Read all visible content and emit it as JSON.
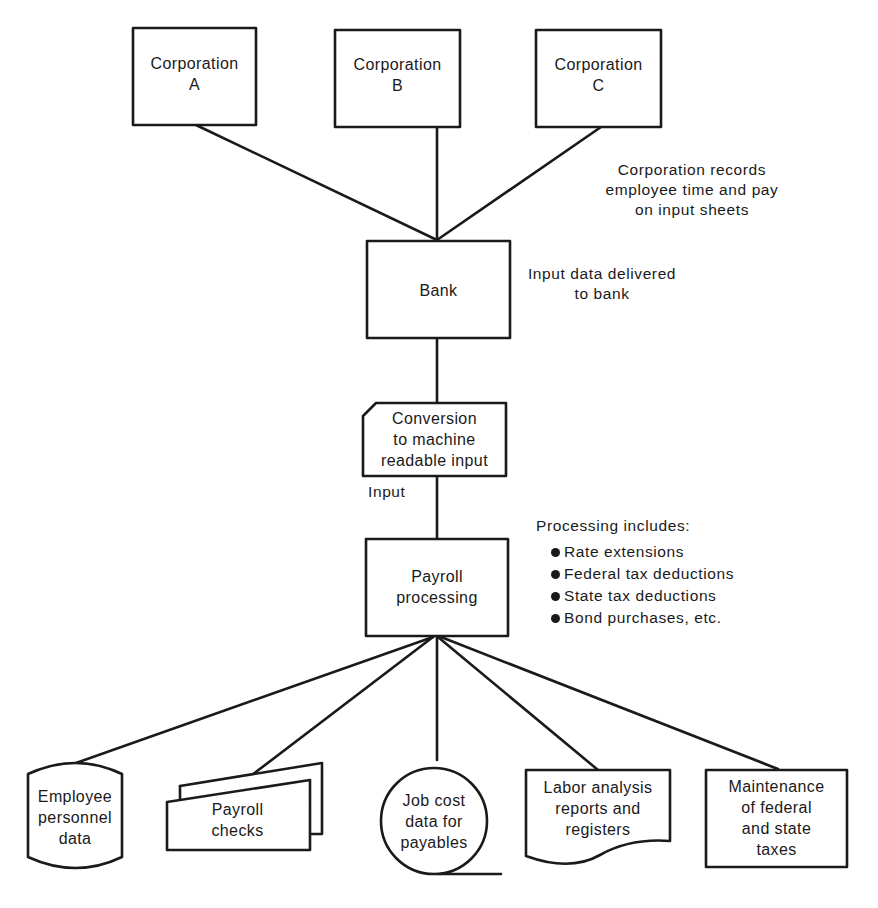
{
  "diagram": {
    "type": "flowchart",
    "nodes": {
      "corp_a": {
        "shape": "process-box",
        "label": "Corporation\nA"
      },
      "corp_b": {
        "shape": "process-box",
        "label": "Corporation\nB"
      },
      "corp_c": {
        "shape": "process-box",
        "label": "Corporation\nC"
      },
      "bank": {
        "shape": "process-box",
        "label": "Bank"
      },
      "conversion": {
        "shape": "punched-card",
        "label": "Conversion\nto machine\nreadable input"
      },
      "payroll": {
        "shape": "process-box",
        "label": "Payroll\nprocessing"
      },
      "employee_data": {
        "shape": "magnetic-disk",
        "label": "Employee\npersonnel\ndata"
      },
      "payroll_checks": {
        "shape": "multi-document",
        "label": "Payroll\nchecks"
      },
      "job_cost": {
        "shape": "magnetic-tape",
        "label": "Job cost\ndata for\npayables"
      },
      "labor_analysis": {
        "shape": "document",
        "label": "Labor analysis\nreports and\nregisters"
      },
      "tax_maintenance": {
        "shape": "process-box",
        "label": "Maintenance\nof federal\nand state\ntaxes"
      }
    },
    "annotations": {
      "corp_note": "Corporation records\nemployee time and pay\non input sheets",
      "bank_note": "Input data delivered\nto bank",
      "input_note": "Input",
      "processing_title": "Processing includes:",
      "processing_items": [
        "Rate extensions",
        "Federal tax deductions",
        "State tax deductions",
        "Bond purchases, etc."
      ]
    },
    "edges": [
      {
        "from": "corp_a",
        "to": "bank"
      },
      {
        "from": "corp_b",
        "to": "bank"
      },
      {
        "from": "corp_c",
        "to": "bank"
      },
      {
        "from": "bank",
        "to": "conversion"
      },
      {
        "from": "conversion",
        "to": "payroll",
        "label": "Input"
      },
      {
        "from": "payroll",
        "to": "employee_data"
      },
      {
        "from": "payroll",
        "to": "payroll_checks"
      },
      {
        "from": "payroll",
        "to": "job_cost"
      },
      {
        "from": "payroll",
        "to": "labor_analysis"
      },
      {
        "from": "payroll",
        "to": "tax_maintenance"
      }
    ],
    "colors": {
      "line": "#1a1a1a",
      "background": "#ffffff"
    }
  }
}
